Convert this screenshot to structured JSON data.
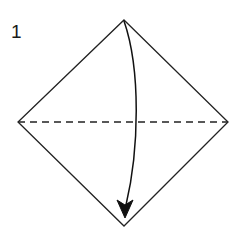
{
  "figure": {
    "type": "origami-instruction-diagram",
    "step_number": "1",
    "background_color": "#ffffff",
    "line_color": "#222222",
    "fold_line_color": "#222222",
    "arrow_color": "#111111"
  },
  "shape": {
    "name": "square-rotated-45-diamond",
    "vertices": {
      "top": {
        "x": 124,
        "y": 20
      },
      "right": {
        "x": 228,
        "y": 122
      },
      "bottom": {
        "x": 124,
        "y": 226
      },
      "left": {
        "x": 18,
        "y": 122
      }
    },
    "outline_points": "124,20 228,122 124,226 18,122",
    "stroke_width": "1.3"
  },
  "fold_line": {
    "name": "horizontal-valley-fold-line",
    "style": "dashed",
    "dash_pattern": "7 5",
    "stroke_width": "1.3",
    "x1": 18,
    "y1": 122,
    "x2": 228,
    "y2": 122
  },
  "fold_arrow": {
    "name": "fold-direction-arrow",
    "description": "curved arrow from top vertex to bottom vertex",
    "path": "M 124 21 C 141 70 139 150 126 205",
    "stroke_width": "1.5",
    "arrowhead_points": "125,218 117,200 125,205 133,200",
    "tip": {
      "x": 125,
      "y": 218
    }
  },
  "labels": {
    "step_number": "1",
    "step_number_position": {
      "x": 11,
      "y": 38
    }
  }
}
